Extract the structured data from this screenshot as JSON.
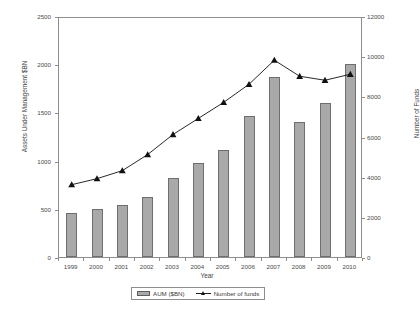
{
  "chart_data": {
    "type": "bar",
    "title": "",
    "xlabel": "Year",
    "ylabel": "Assets Under Management $BN",
    "ylabel_secondary": "Number of Funds",
    "categories": [
      "1999",
      "2000",
      "2001",
      "2002",
      "2003",
      "2004",
      "2005",
      "2006",
      "2007",
      "2008",
      "2009",
      "2010"
    ],
    "ylim": [
      0,
      2500
    ],
    "ylim_secondary": [
      0,
      12000
    ],
    "yticks": [
      0,
      500,
      1000,
      1500,
      2000,
      2500
    ],
    "yticks_secondary": [
      0,
      2000,
      4000,
      6000,
      8000,
      10000,
      12000
    ],
    "grid": false,
    "legend_position": "bottom-center",
    "series": [
      {
        "name": "AUM ($BN)",
        "type": "bar",
        "axis": "left",
        "color": "#a9a9a9",
        "edge_color": "#6e6e6e",
        "values": [
          460,
          500,
          540,
          625,
          820,
          975,
          1105,
          1465,
          1870,
          1400,
          1600,
          2000
        ]
      },
      {
        "name": "Number of funds",
        "type": "line",
        "axis": "right",
        "color": "#111111",
        "marker": "triangle",
        "values": [
          3700,
          4000,
          4400,
          5200,
          6200,
          7000,
          7800,
          8700,
          9900,
          9100,
          8900,
          9200
        ]
      }
    ]
  },
  "axes": {
    "left": {
      "title": "Assets Under Management $BN",
      "ticks": [
        "0",
        "500",
        "1000",
        "1500",
        "2000",
        "2500"
      ]
    },
    "right": {
      "title": "Number of Funds",
      "ticks": [
        "0",
        "2000",
        "4000",
        "6000",
        "8000",
        "10000",
        "12000"
      ]
    },
    "bottom": {
      "title": "Year",
      "ticks": [
        "1999",
        "2000",
        "2001",
        "2002",
        "2003",
        "2004",
        "2005",
        "2006",
        "2007",
        "2008",
        "2009",
        "2010"
      ]
    }
  },
  "legend": {
    "entries": [
      {
        "label": "AUM ($BN)"
      },
      {
        "label": "Number of funds"
      }
    ]
  }
}
